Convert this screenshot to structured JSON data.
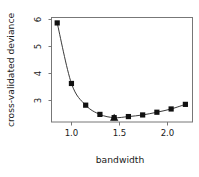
{
  "chart_data": {
    "type": "line",
    "title": "",
    "xlabel": "bandwidth",
    "ylabel": "cross-validated deviance",
    "x": [
      0.6,
      0.8,
      1.0,
      1.2,
      1.4,
      1.6,
      1.8,
      2.0,
      2.2,
      2.4
    ],
    "values": [
      5.85,
      3.62,
      2.82,
      2.48,
      2.36,
      2.4,
      2.46,
      2.56,
      2.68,
      2.85
    ],
    "series": [
      {
        "name": "cross-validated deviance",
        "values": [
          5.85,
          3.62,
          2.82,
          2.48,
          2.36,
          2.4,
          2.46,
          2.56,
          2.68,
          2.85
        ]
      }
    ],
    "xlim": [
      0.52,
      2.5
    ],
    "ylim": [
      2.2,
      6.05
    ],
    "xticks": [
      1.0,
      1.5,
      2.0
    ],
    "xtick_labels": [
      "1.0",
      "1.5",
      "2.0"
    ],
    "yticks": [
      3,
      4,
      5,
      6
    ],
    "ytick_labels": [
      "3",
      "4",
      "5",
      "6"
    ],
    "grid": false,
    "legend": null,
    "marker": "filled-square",
    "annotations": [
      {
        "name": "minimum-marker",
        "marker": "filled-triangle",
        "x": 1.4,
        "y": 2.36
      }
    ],
    "colors": {
      "line": "#3a3a3a",
      "marker": "#111111",
      "frame": "#777777",
      "text": "#1a1a1a",
      "background": "#ffffff"
    }
  }
}
